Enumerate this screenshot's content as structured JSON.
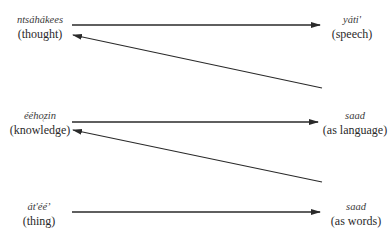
{
  "diagram": {
    "left_nodes": [
      {
        "native": "ntsáhákees",
        "gloss": "(thought)"
      },
      {
        "native": "éého̜zin",
        "gloss": "(knowledge)"
      },
      {
        "native": "át'ééʼ",
        "gloss": "(thing)"
      }
    ],
    "right_nodes": [
      {
        "native": "yáti'",
        "gloss": "(speech)"
      },
      {
        "native": "saad",
        "gloss": "(as language)"
      },
      {
        "native": "saad",
        "gloss": "(as words)"
      }
    ],
    "edges": [
      {
        "from": "ntsáhákees (thought)",
        "to": "yáti' (speech)",
        "direction": "right"
      },
      {
        "from": "saad (as language)",
        "to": "ntsáhákees (thought)",
        "direction": "left-diagonal"
      },
      {
        "from": "éého̜zin (knowledge)",
        "to": "saad (as language)",
        "direction": "right"
      },
      {
        "from": "saad (as words)",
        "to": "éého̜zin (knowledge)",
        "direction": "left-diagonal"
      },
      {
        "from": "át'ééʼ (thing)",
        "to": "saad (as words)",
        "direction": "right"
      }
    ],
    "colors": {
      "line": "#2a2a2a",
      "text": "#2a2a2a"
    }
  }
}
